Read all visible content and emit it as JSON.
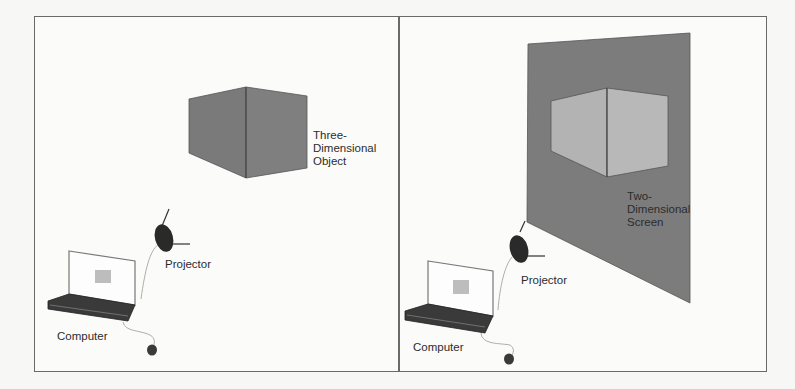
{
  "figure": {
    "panels": [
      {
        "id": "left",
        "description": "Three-dimensional object projected in space",
        "labels": {
          "object": "Three-\nDimensional\nObject",
          "projector": "Projector",
          "computer": "Computer"
        }
      },
      {
        "id": "right",
        "description": "Image projected onto a two-dimensional screen",
        "labels": {
          "screen": "Two-\nDimensional\nScreen",
          "projector": "Projector",
          "computer": "Computer"
        }
      }
    ],
    "colors": {
      "border": "#6a6a6a",
      "object_fill": "#7a7a7a",
      "screen_fill": "#7c7c7c",
      "projected_cube_fill": "#b3b3b3",
      "projector_fill": "#2a2a2a",
      "laptop_base": "#3a3a3a",
      "background": "#fbfbfa"
    }
  }
}
